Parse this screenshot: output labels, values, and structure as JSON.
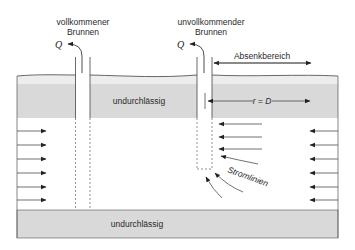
{
  "wells": [
    {
      "label_line1": "vollkommener",
      "label_line2": "Brunnen",
      "discharge": "Q"
    },
    {
      "label_line1": "unvollkommender",
      "label_line2": "Brunnen",
      "discharge": "Q"
    }
  ],
  "layers": {
    "top": "undurchlässig",
    "bottom": "undurchlässig"
  },
  "annotations": {
    "drawdown_zone": "Absenkbereich",
    "radius": "r = D",
    "streamlines": "Stromlinien"
  },
  "colors": {
    "impermeable_fill": "#dcdcdc",
    "line": "#3a3a3a",
    "background": "#ffffff"
  }
}
